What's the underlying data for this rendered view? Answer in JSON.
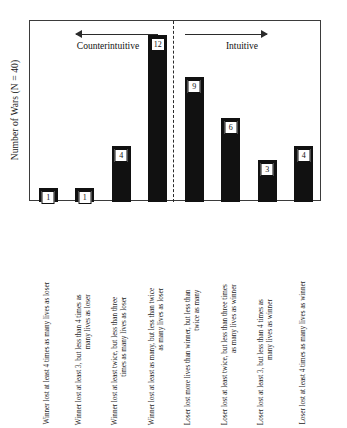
{
  "axis": {
    "ylabel": "Number of Wars (N = 40)"
  },
  "regions": [
    {
      "name": "counterintuitive",
      "label": "Counterintuitive",
      "arrow": "left-arrow-icon"
    },
    {
      "name": "intuitive",
      "label": "Intuitive",
      "arrow": "right-arrow-icon"
    }
  ],
  "colors": {
    "bar": "#111111",
    "frame": "#3b3b3b",
    "divider": "#2b2b2b",
    "background": "#ffffff",
    "label_box": "#ffffff"
  },
  "chart_data": {
    "type": "bar",
    "title": "",
    "xlabel": "",
    "ylabel": "Number of Wars (N = 40)",
    "ylim": [
      0,
      13
    ],
    "grid": false,
    "legend": "none",
    "categories": [
      "Winner lost at least 4 times as many lives as loser",
      "Winner lost at least 3, but less than 4 times as many lives as loser",
      "Winner lost at least twice, but less than three times as many lives as loser",
      "Winner lost at least as many, but less than twice as many lives as loser",
      "Loser lost more lives than winner, but less than twice as many",
      "Loser lost at least twice, but less than three times as many lives as winner",
      "Loser lost at least 3, but less than 4 times as many lives as winner",
      "Loser lost at least 4 times as many lives as winner"
    ],
    "category_lines": [
      [
        "Winner lost at least 4 times as many lives as loser",
        ""
      ],
      [
        "Winner lost at least 3, but less than 4 times as",
        "many lives as loser"
      ],
      [
        "Winner lost at least twice, but less than three",
        "times as many lives as loser"
      ],
      [
        "Winner lost at least as many, but less than twice",
        "as many lives as loser"
      ],
      [
        "Loser lost more lives than winner, but less than",
        "twice as many"
      ],
      [
        "Loser lost at least twice, but less than three times",
        "as many lives as winner"
      ],
      [
        "Loser lost at least 3, but less than 4 times as",
        "many lives as winner"
      ],
      [
        "Loser lost at least 4 times as many lives as winner",
        ""
      ]
    ],
    "values": [
      1,
      1,
      4,
      12,
      9,
      6,
      3,
      4
    ],
    "groups": [
      "Counterintuitive",
      "Counterintuitive",
      "Counterintuitive",
      "Counterintuitive",
      "Intuitive",
      "Intuitive",
      "Intuitive",
      "Intuitive"
    ],
    "annotations": [
      "Counterintuitive",
      "Intuitive"
    ],
    "divider_after_category_index": 3,
    "total": 40
  }
}
